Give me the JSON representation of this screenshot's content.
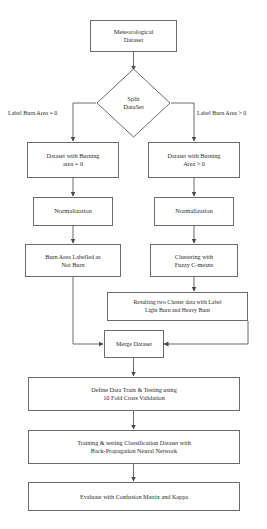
{
  "diagram": {
    "stroke_color": "#6b6b6b",
    "text_color": "#2b2b2b",
    "background_color": "#ffffff"
  },
  "nodes": {
    "source": {
      "line1": "Meteorological",
      "line2": "Dataset"
    },
    "decision": {
      "line1": "Split",
      "line2": "DataSet"
    },
    "left_dataset": {
      "line1": "Dataset with Burning",
      "line2": "area = 0"
    },
    "right_dataset": {
      "line1": "Dataset with Burning",
      "line2": "Area > 0"
    },
    "left_normalization": {
      "line1": "Normalization"
    },
    "right_normalization": {
      "line1": "Normalization"
    },
    "not_burn": {
      "line1": "Burn Area Labelled as",
      "line2": "Not Burn"
    },
    "clustering": {
      "line1": "Clustering with",
      "line2": "Fuzzy C-means"
    },
    "cluster_result": {
      "line1": "Resulting two Cluster data with Label",
      "line2": "Light Burn and Heavy Burn"
    },
    "merge": {
      "line1": "Merge Dataset"
    },
    "cross_validation": {
      "line1": "Define Data Train & Testing using",
      "line2": "10 Fold Cross Validation"
    },
    "training": {
      "line1": "Training & testing Classification Dataset with",
      "line2": "Back-Propagation Neural Network"
    },
    "evaluate": {
      "line1": "Evaluate with Confusion Matrix and Kappa"
    }
  },
  "edge_labels": {
    "left_branch": "Label Burn Area = 0",
    "right_branch": "Label Burn Area > 0"
  }
}
